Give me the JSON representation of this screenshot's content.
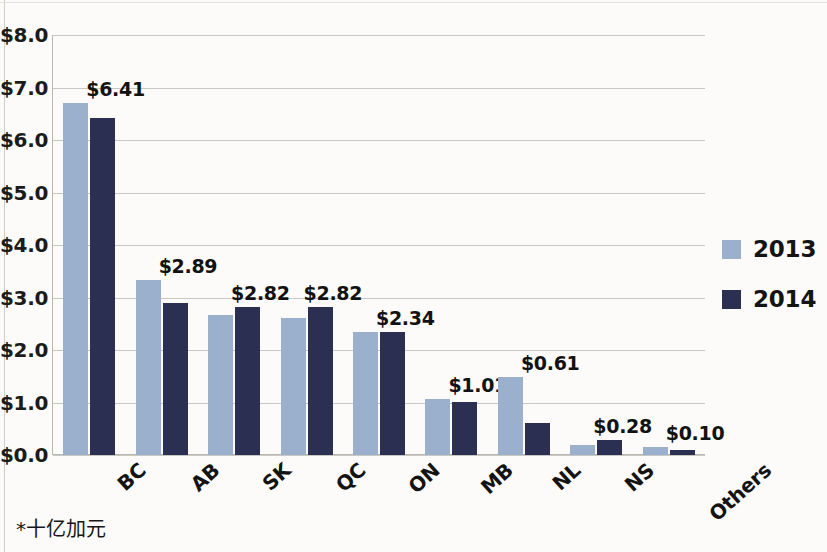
{
  "chart_data": {
    "type": "bar",
    "title": "",
    "subtitle": "",
    "xlabel": "",
    "ylabel": "",
    "categories": [
      "BC",
      "AB",
      "SK",
      "QC",
      "ON",
      "MB",
      "NL",
      "NS",
      "Others"
    ],
    "series": [
      {
        "name": "2013",
        "color": "#9bb0cd",
        "values": [
          6.7,
          3.34,
          2.66,
          2.61,
          2.34,
          1.06,
          1.49,
          0.2,
          0.15
        ]
      },
      {
        "name": "2014",
        "color": "#2b2f52",
        "values": [
          6.41,
          2.89,
          2.82,
          2.82,
          2.34,
          1.01,
          0.61,
          0.28,
          0.1
        ]
      }
    ],
    "data_labels": [
      "$6.41",
      "$2.89",
      "$2.82",
      "$2.82",
      "$2.34",
      "$1.01",
      "$0.61",
      "$0.28",
      "$0.10"
    ],
    "ylim": [
      0,
      8
    ],
    "ytick_step": 1,
    "ytick_labels": [
      "$8.0",
      "$7.0",
      "$6.0",
      "$5.0",
      "$4.0",
      "$3.0",
      "$2.0",
      "$1.0",
      "$0.0"
    ],
    "ytick_values": [
      8,
      7,
      6,
      5,
      4,
      3,
      2,
      1,
      0
    ],
    "grid": true,
    "legend_position": "right",
    "legend": [
      "2013",
      "2014"
    ],
    "footnote": "*十亿加元"
  }
}
